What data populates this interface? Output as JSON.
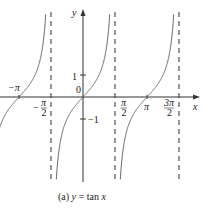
{
  "figure": {
    "caption": "(a) y = tan x",
    "caption_prefix": "(a) ",
    "caption_y": "y",
    "caption_eq": " = tan ",
    "caption_x": "x",
    "function": "y = tan x",
    "axes": {
      "x_label": "x",
      "y_label": "y"
    },
    "x_ticks": [
      {
        "label": "−π",
        "value": -3.14159
      },
      {
        "label": "−π/2",
        "value": -1.5708
      },
      {
        "label": "π/2",
        "value": 1.5708
      },
      {
        "label": "π",
        "value": 3.14159
      },
      {
        "label": "3π/2",
        "value": 4.7124
      }
    ],
    "y_ticks": [
      {
        "label": "1",
        "value": 1
      },
      {
        "label": "0",
        "value": 0
      },
      {
        "label": "−1",
        "value": -1
      }
    ],
    "asymptotes": [
      "−π/2",
      "π/2",
      "3π/2"
    ],
    "labels": {
      "neg_pi": "−π",
      "neg": "−",
      "pi": "π",
      "two": "2",
      "three_pi": "3π",
      "one": "1",
      "zero": "0",
      "neg_one": "−1"
    }
  }
}
